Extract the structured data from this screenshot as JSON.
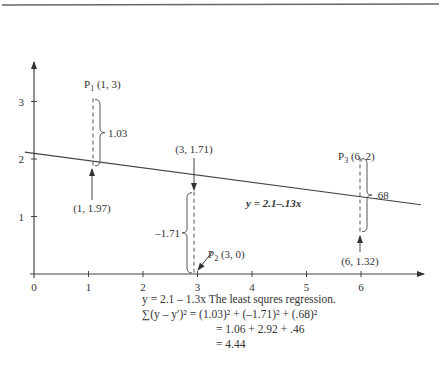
{
  "chart_data": {
    "type": "scatter",
    "title": "",
    "xlabel": "",
    "ylabel": "",
    "xlim": [
      0,
      7
    ],
    "ylim": [
      0,
      4
    ],
    "x_ticks": [
      0,
      1,
      2,
      3,
      4,
      5,
      6
    ],
    "y_ticks": [
      1,
      2,
      3
    ],
    "grid": false,
    "points": [
      {
        "name": "P1",
        "label": "P",
        "sub": "1",
        "coords": " (1, 3)",
        "x": 1,
        "y": 3
      },
      {
        "name": "P2",
        "label": "P",
        "sub": "2",
        "coords": " (3, 0)",
        "x": 3,
        "y": 0
      },
      {
        "name": "P3",
        "label": "P",
        "sub": "3",
        "coords": " (6, 2)",
        "x": 6,
        "y": 2
      }
    ],
    "regression_line": {
      "intercept": 2.1,
      "slope": -0.13,
      "label": "y = 2.1–.13x"
    },
    "fitted_points": [
      {
        "label": "(1, 1.97)",
        "x": 1,
        "y": 1.97
      },
      {
        "label": "(3, 1.71)",
        "x": 3,
        "y": 1.71
      },
      {
        "label": "(6, 1.32)",
        "x": 6,
        "y": 1.32
      }
    ],
    "residuals": [
      {
        "label": "1.03",
        "value": 1.03
      },
      {
        "label": "–1.71",
        "value": -1.71
      },
      {
        "label": ".68",
        "value": 0.68
      }
    ]
  },
  "caption": {
    "line1": "y = 2.1 – 1.3x The least squres regression.",
    "line2": "∑(y – y′)² = (1.03)² + (–1.71)² + (.68)²",
    "line3": "= 1.06 + 2.92 + .46",
    "line4": "= 4.44"
  }
}
